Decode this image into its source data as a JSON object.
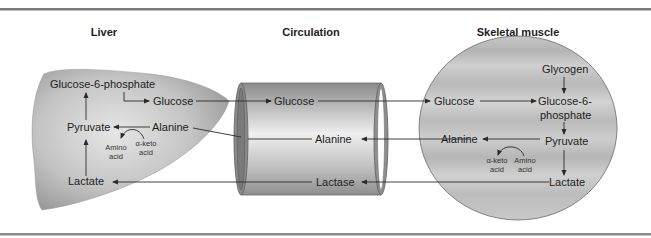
{
  "colors": {
    "rule": "#7a7a7a",
    "organ_light": "#d9d9d9",
    "organ_dark": "#8f8f8f",
    "line": "#2a2a2a",
    "text": "#1e1e1e"
  },
  "headers": {
    "liver": "Liver",
    "circulation": "Circulation",
    "muscle": "Skeletal muscle"
  },
  "liver": {
    "g6p": "Glucose-6-phosphate",
    "glucose": "Glucose",
    "pyruvate": "Pyruvate",
    "alanine": "Alanine",
    "amino_acid_1": "Amino",
    "amino_acid_2": "acid",
    "keto_acid_1": "α-keto",
    "keto_acid_2": "acid",
    "lactate": "Lactate"
  },
  "circulation": {
    "glucose": "Glucose",
    "alanine": "Alanine",
    "lactate": "Lactase"
  },
  "muscle": {
    "glycogen": "Glycogen",
    "glucose": "Glucose",
    "g6p_1": "Glucose-6-",
    "g6p_2": "phosphate",
    "alanine": "Alanine",
    "pyruvate": "Pyruvate",
    "keto_acid_1": "α-keto",
    "keto_acid_2": "acid",
    "amino_acid_1": "Amino",
    "amino_acid_2": "acid",
    "lactate": "Lactate"
  }
}
